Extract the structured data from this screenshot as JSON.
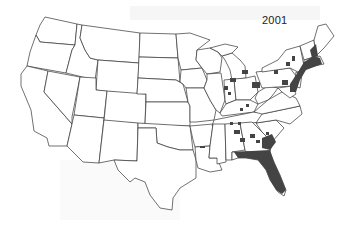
{
  "map": {
    "title": "2001",
    "region": "Contiguous United States",
    "fill_color": "#444444",
    "outline_color": "#333333",
    "background": "#ffffff",
    "shaded_regions": [
      "Florida (most of state)",
      "Southeast Georgia coast",
      "Northeast corridor (NJ, CT, MA, RI, eastern NY, eastern PA, MD)",
      "Scattered counties in MI, OH, IN, KY, TN, AL, GA, SC, NC, AR, MS, LA, IL, WI, NY, PA, ME"
    ]
  }
}
